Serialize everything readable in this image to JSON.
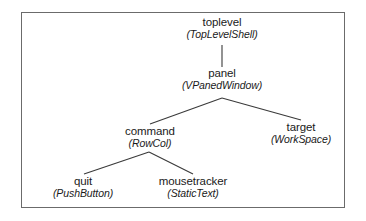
{
  "diagram": {
    "border_color": "#6b6b6b",
    "text_color": "#1a1a1a",
    "line_color": "#3a3a3a",
    "background": "#ffffff",
    "nodes": [
      {
        "id": "toplevel",
        "name": "toplevel",
        "class": "(TopLevelShell)"
      },
      {
        "id": "panel",
        "name": "panel",
        "class": "(VPanedWindow)"
      },
      {
        "id": "command",
        "name": "command",
        "class": "(RowCol)"
      },
      {
        "id": "target",
        "name": "target",
        "class": "(WorkSpace)"
      },
      {
        "id": "quit",
        "name": "quit",
        "class": "(PushButton)"
      },
      {
        "id": "mousetracker",
        "name": "mousetracker",
        "class": "(StaticText)"
      }
    ],
    "edges": [
      {
        "from": "toplevel",
        "to": "panel"
      },
      {
        "from": "panel",
        "to": "command"
      },
      {
        "from": "panel",
        "to": "target"
      },
      {
        "from": "command",
        "to": "quit"
      },
      {
        "from": "command",
        "to": "mousetracker"
      }
    ]
  }
}
